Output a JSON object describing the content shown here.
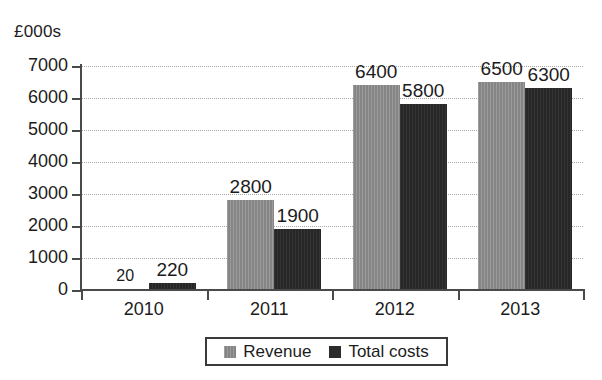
{
  "chart_data": {
    "type": "bar",
    "title": "",
    "subtitle": "",
    "xlabel": "",
    "ylabel": "£000s",
    "unit_label": "£000s",
    "categories": [
      "2010",
      "2011",
      "2012",
      "2013"
    ],
    "series": [
      {
        "name": "Revenue",
        "color": "#8d8d8d",
        "values": [
          20,
          2800,
          6400,
          6500
        ],
        "labels": [
          "20",
          "2800",
          "6400",
          "6500"
        ]
      },
      {
        "name": "Total costs",
        "color": "#2b2b2b",
        "values": [
          220,
          1900,
          5800,
          6300
        ],
        "labels": [
          "220",
          "1900",
          "5800",
          "6300"
        ]
      }
    ],
    "ylim": [
      0,
      7000
    ],
    "yticks": [
      0,
      1000,
      2000,
      3000,
      4000,
      5000,
      6000,
      7000
    ],
    "ytick_labels": [
      "0",
      "1000",
      "2000",
      "3000",
      "4000",
      "5000",
      "6000",
      "7000"
    ],
    "grid": true,
    "grid_style": "dotted",
    "legend_position": "bottom",
    "data_labels": true
  },
  "legend": {
    "items": [
      {
        "label": "Revenue",
        "swatch": "revenue-swatch"
      },
      {
        "label": "Total costs",
        "swatch": "total-costs-swatch"
      }
    ]
  }
}
